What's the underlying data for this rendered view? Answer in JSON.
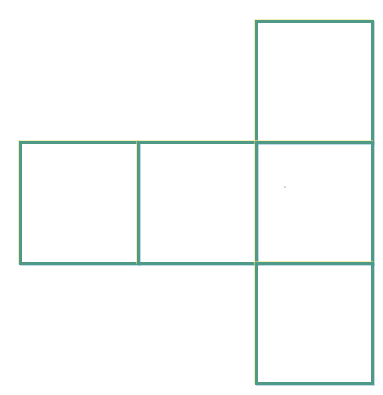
{
  "figure": {
    "line_color": "#4f9a86",
    "background": "#ffffff",
    "squares": [
      {
        "id": "top",
        "left": 255,
        "top": 20,
        "size": 119
      },
      {
        "id": "middle-left",
        "left": 19,
        "top": 141,
        "size": 121
      },
      {
        "id": "middle-center",
        "left": 137,
        "top": 141,
        "size": 121
      },
      {
        "id": "middle-right",
        "left": 255,
        "top": 141,
        "size": 121
      },
      {
        "id": "bottom",
        "left": 255,
        "top": 262,
        "size": 121
      }
    ]
  }
}
